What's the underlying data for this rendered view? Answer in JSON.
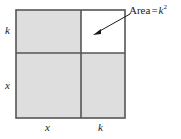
{
  "figure": {
    "type": "geometric-diagram",
    "colors": {
      "shaded_fill": "#dedede",
      "unshaded_fill": "#ffffff",
      "stroke": "#555555",
      "text": "#1a1a1a"
    },
    "square": {
      "left": 16,
      "top": 10,
      "right": 125,
      "bottom": 118,
      "split_x": 81,
      "split_y": 53
    },
    "regions": [
      {
        "name": "top-left",
        "shaded": true,
        "width_label": "x",
        "height_label": "k"
      },
      {
        "name": "top-right",
        "shaded": false,
        "width_label": "k",
        "height_label": "k"
      },
      {
        "name": "bottom-left",
        "shaded": true,
        "width_label": "x",
        "height_label": "x"
      },
      {
        "name": "bottom-right",
        "shaded": true,
        "width_label": "k",
        "height_label": "x"
      }
    ],
    "edge_labels": {
      "left_top": "k",
      "left_bottom": "x",
      "bottom_left": "x",
      "bottom_right": "k"
    },
    "callout": {
      "text": "Area = k2",
      "prefix": "Area",
      "equals": "=",
      "variable": "k",
      "exponent": "2",
      "points_to": "top-right",
      "arrow_from_x": 129,
      "arrow_from_y": 15,
      "arrow_to_x": 94,
      "arrow_to_y": 34
    }
  }
}
